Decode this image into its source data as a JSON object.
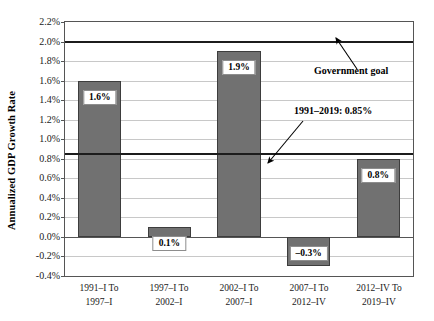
{
  "chart_data": {
    "type": "bar",
    "title": "",
    "xlabel": "",
    "ylabel": "Annualized GDP Growth Rate",
    "ylim": [
      -0.4,
      2.2
    ],
    "ytick_step": 0.2,
    "grid": true,
    "legend": "none",
    "categories": [
      "1991–I To 1997–I",
      "1997–I To 2002–I",
      "2002–I To 2007–I",
      "2007–I To 2012–IV",
      "2012–IV To 2019–IV"
    ],
    "category_lines": [
      [
        "1991–I To",
        "1997–I"
      ],
      [
        "1997–I To",
        "2002–I"
      ],
      [
        "2002–I To",
        "2007–I"
      ],
      [
        "2007–I To",
        "2012–IV"
      ],
      [
        "2012–IV To",
        "2019–IV"
      ]
    ],
    "values": [
      1.6,
      0.1,
      1.9,
      -0.3,
      0.8
    ],
    "value_labels": [
      "1.6%",
      "0.1%",
      "1.9%",
      "–0.3%",
      "0.8%"
    ],
    "ytick_labels": [
      "2.2%",
      "2.0%",
      "1.8%",
      "1.6%",
      "1.4%",
      "1.2%",
      "1.0%",
      "0.8%",
      "0.6%",
      "0.4%",
      "0.2%",
      "0.0%",
      "-0.2%",
      "-0.4%"
    ],
    "ytick_values": [
      2.2,
      2.0,
      1.8,
      1.6,
      1.4,
      1.2,
      1.0,
      0.8,
      0.6,
      0.4,
      0.2,
      0.0,
      -0.2,
      -0.4
    ],
    "reference_lines": [
      {
        "name": "government-goal",
        "value": 2.0,
        "label": "Government goal"
      },
      {
        "name": "average-1991-2019",
        "value": 0.85,
        "label": "1991–2019: 0.85%"
      }
    ],
    "annotations": [
      {
        "name": "government-goal-annotation",
        "text": "Government goal"
      },
      {
        "name": "average-annotation",
        "text": "1991–2019: 0.85%"
      }
    ],
    "colors": {
      "bar_fill": "#717171",
      "bar_edge": "#3d3d3d",
      "gridline": "#c8c8c8",
      "reference_line": "#1c1c1c",
      "axis": "#555555",
      "background": "#ffffff"
    }
  }
}
